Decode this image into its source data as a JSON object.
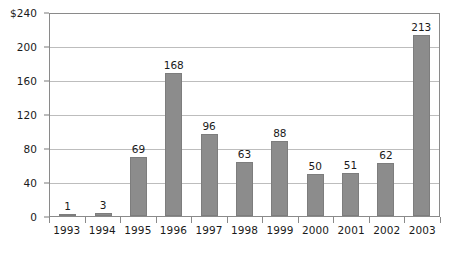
{
  "chart_data": {
    "type": "bar",
    "title": "",
    "subtitle": "",
    "xlabel": "",
    "ylabel": "",
    "categories": [
      "1993",
      "1994",
      "1995",
      "1996",
      "1997",
      "1998",
      "1999",
      "2000",
      "2001",
      "2002",
      "2003"
    ],
    "values": [
      1,
      3,
      69,
      168,
      96,
      63,
      88,
      50,
      51,
      62,
      213
    ],
    "data_labels": [
      "1",
      "3",
      "69",
      "168",
      "96",
      "63",
      "88",
      "50",
      "51",
      "62",
      "213"
    ],
    "ylim": [
      0,
      240
    ],
    "y_ticks": [
      0,
      40,
      80,
      120,
      160,
      200,
      240
    ],
    "y_tick_labels": [
      "0",
      "40",
      "80",
      "120",
      "160",
      "200",
      "$240"
    ],
    "grid": true,
    "grid_axis": "y",
    "legend": false,
    "legend_position": "none",
    "series": [
      {
        "name": "",
        "values": [
          1,
          3,
          69,
          168,
          96,
          63,
          88,
          50,
          51,
          62,
          213
        ]
      }
    ],
    "colors": {
      "bar_fill": "#8c8c8c",
      "bar_stroke": "#7d7d7d",
      "gridline": "#bdbdbd",
      "axis": "#8a8a8a",
      "text": "#1a1a1a",
      "background": "#ffffff"
    }
  }
}
